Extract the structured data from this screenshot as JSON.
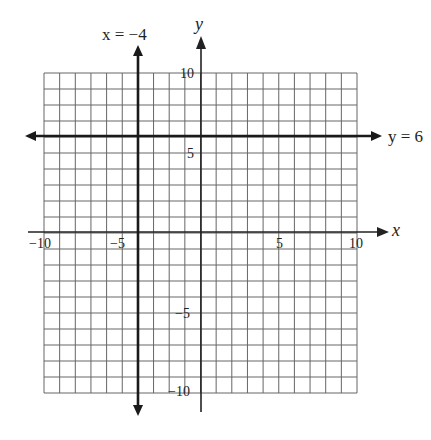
{
  "chart_data": {
    "type": "line",
    "title": "",
    "xlabel": "x",
    "ylabel": "y",
    "xlim": [
      -10,
      10
    ],
    "ylim": [
      -10,
      10
    ],
    "grid": true,
    "x_ticks": [
      "-10",
      "-5",
      "5",
      "10"
    ],
    "y_ticks": [
      "10",
      "5",
      "-5",
      "-10"
    ],
    "series": [
      {
        "name": "x = -4",
        "kind": "vertical-line",
        "x": -4
      },
      {
        "name": "y = 6",
        "kind": "horizontal-line",
        "y": 6
      }
    ]
  },
  "labels": {
    "x_axis": "x",
    "y_axis": "y",
    "vertical_line": "x = −4",
    "horizontal_line": "y = 6",
    "tick_x_neg10": "−10",
    "tick_x_neg5": "−5",
    "tick_x_5": "5",
    "tick_x_10": "10",
    "tick_y_10": "10",
    "tick_y_5": "5",
    "tick_y_neg5": "−5",
    "tick_y_neg10": "−10"
  },
  "colors": {
    "grid": "#555555",
    "axis": "#222222",
    "line": "#1a1a1a"
  }
}
